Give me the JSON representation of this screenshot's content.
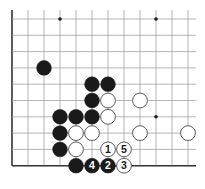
{
  "diagram": {
    "grid": {
      "origin_x": 12,
      "origin_y": 19,
      "spacing_x": 16,
      "spacing_y": 16.3,
      "cols": 12,
      "rows": 10,
      "left_edge": true,
      "bottom_edge": true,
      "line_color": "#9a9a9a",
      "edge_color": "#333333"
    },
    "star_points": [
      {
        "col": 3,
        "row": 0
      },
      {
        "col": 9,
        "row": 0
      },
      {
        "col": 9,
        "row": 6
      }
    ],
    "stones": [
      {
        "color": "black",
        "col": 2,
        "row": 3,
        "label": ""
      },
      {
        "color": "black",
        "col": 5,
        "row": 4,
        "label": ""
      },
      {
        "color": "black",
        "col": 6,
        "row": 4,
        "label": ""
      },
      {
        "color": "black",
        "col": 5,
        "row": 5,
        "label": ""
      },
      {
        "color": "white",
        "col": 6,
        "row": 5,
        "label": ""
      },
      {
        "color": "white",
        "col": 8,
        "row": 5,
        "label": ""
      },
      {
        "color": "black",
        "col": 3,
        "row": 6,
        "label": ""
      },
      {
        "color": "black",
        "col": 4,
        "row": 6,
        "label": ""
      },
      {
        "color": "black",
        "col": 5,
        "row": 6,
        "label": ""
      },
      {
        "color": "white",
        "col": 6,
        "row": 6,
        "label": ""
      },
      {
        "color": "black",
        "col": 3,
        "row": 7,
        "label": ""
      },
      {
        "color": "white",
        "col": 4,
        "row": 7,
        "label": ""
      },
      {
        "color": "white",
        "col": 5,
        "row": 7,
        "label": ""
      },
      {
        "color": "white",
        "col": 8,
        "row": 7,
        "label": ""
      },
      {
        "color": "white",
        "col": 11,
        "row": 7,
        "label": ""
      },
      {
        "color": "black",
        "col": 3,
        "row": 8,
        "label": ""
      },
      {
        "color": "white",
        "col": 4,
        "row": 8,
        "label": ""
      },
      {
        "color": "white",
        "col": 6,
        "row": 8,
        "label": "1"
      },
      {
        "color": "white",
        "col": 7,
        "row": 8,
        "label": "5"
      },
      {
        "color": "black",
        "col": 4,
        "row": 9,
        "label": ""
      },
      {
        "color": "black",
        "col": 5,
        "row": 9,
        "label": "4"
      },
      {
        "color": "black",
        "col": 6,
        "row": 9,
        "label": "2"
      },
      {
        "color": "white",
        "col": 7,
        "row": 9,
        "label": "3"
      }
    ],
    "colors": {
      "black_stone": "#1a1a1a",
      "white_stone": "#ffffff",
      "white_stone_border": "#333333",
      "black_label": "#ffffff",
      "white_label": "#1a1a1a"
    }
  }
}
